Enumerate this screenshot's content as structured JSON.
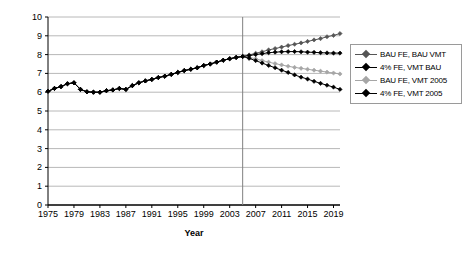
{
  "chart_data": {
    "type": "line",
    "title": "",
    "xlabel": "Year",
    "ylabel": "Million barrels gasoline/day",
    "xlim": [
      1975,
      2020
    ],
    "ylim": [
      0,
      10
    ],
    "yticks": [
      0,
      1,
      2,
      3,
      4,
      5,
      6,
      7,
      8,
      9,
      10
    ],
    "xticks": [
      1975,
      1979,
      1983,
      1987,
      1991,
      1995,
      1999,
      2003,
      2007,
      2011,
      2015,
      2019
    ],
    "grid": true,
    "legend_position": "right",
    "annotations": [
      {
        "type": "vline",
        "x": 2005,
        "label": ""
      }
    ],
    "x": [
      1975,
      1976,
      1977,
      1978,
      1979,
      1980,
      1981,
      1982,
      1983,
      1984,
      1985,
      1986,
      1987,
      1988,
      1989,
      1990,
      1991,
      1992,
      1993,
      1994,
      1995,
      1996,
      1997,
      1998,
      1999,
      2000,
      2001,
      2002,
      2003,
      2004,
      2005,
      2006,
      2007,
      2008,
      2009,
      2010,
      2011,
      2012,
      2013,
      2014,
      2015,
      2016,
      2017,
      2018,
      2019,
      2020
    ],
    "series": [
      {
        "name": "BAU FE, BAU VMT",
        "color": "#555555",
        "marker": "diamond",
        "values": [
          6.05,
          6.2,
          6.3,
          6.45,
          6.5,
          6.15,
          6.02,
          6.0,
          6.0,
          6.08,
          6.12,
          6.2,
          6.15,
          6.35,
          6.5,
          6.6,
          6.68,
          6.78,
          6.85,
          6.95,
          7.05,
          7.15,
          7.22,
          7.3,
          7.42,
          7.5,
          7.6,
          7.7,
          7.78,
          7.85,
          7.9,
          7.98,
          8.07,
          8.15,
          8.25,
          8.32,
          8.4,
          8.48,
          8.55,
          8.62,
          8.7,
          8.78,
          8.85,
          8.95,
          9.02,
          9.12
        ]
      },
      {
        "name": "4% FE, VMT BAU",
        "color": "#000000",
        "marker": "diamond",
        "values": [
          6.05,
          6.2,
          6.3,
          6.45,
          6.5,
          6.15,
          6.02,
          6.0,
          6.0,
          6.08,
          6.12,
          6.2,
          6.15,
          6.35,
          6.5,
          6.6,
          6.68,
          6.78,
          6.85,
          6.95,
          7.05,
          7.15,
          7.22,
          7.3,
          7.42,
          7.5,
          7.6,
          7.7,
          7.78,
          7.85,
          7.9,
          7.95,
          8.0,
          8.05,
          8.1,
          8.13,
          8.15,
          8.16,
          8.16,
          8.15,
          8.13,
          8.12,
          8.1,
          8.09,
          8.08,
          8.08
        ]
      },
      {
        "name": "BAU FE, VMT 2005",
        "color": "#a6a6a6",
        "marker": "diamond",
        "values": [
          6.05,
          6.2,
          6.3,
          6.45,
          6.5,
          6.15,
          6.02,
          6.0,
          6.0,
          6.08,
          6.12,
          6.2,
          6.15,
          6.35,
          6.5,
          6.6,
          6.68,
          6.78,
          6.85,
          6.95,
          7.05,
          7.15,
          7.22,
          7.3,
          7.42,
          7.5,
          7.6,
          7.7,
          7.78,
          7.85,
          7.9,
          7.85,
          7.78,
          7.68,
          7.6,
          7.52,
          7.45,
          7.38,
          7.32,
          7.27,
          7.22,
          7.17,
          7.12,
          7.07,
          7.02,
          6.97
        ]
      },
      {
        "name": "4% FE, VMT 2005",
        "color": "#000000",
        "marker": "diamond",
        "values": [
          6.05,
          6.2,
          6.3,
          6.45,
          6.5,
          6.15,
          6.02,
          6.0,
          6.0,
          6.08,
          6.12,
          6.2,
          6.15,
          6.35,
          6.5,
          6.6,
          6.68,
          6.78,
          6.85,
          6.95,
          7.05,
          7.15,
          7.22,
          7.3,
          7.42,
          7.5,
          7.6,
          7.7,
          7.78,
          7.85,
          7.9,
          7.8,
          7.68,
          7.55,
          7.42,
          7.3,
          7.17,
          7.05,
          6.92,
          6.8,
          6.7,
          6.58,
          6.47,
          6.37,
          6.27,
          6.15
        ]
      }
    ]
  },
  "legend": {
    "items": [
      {
        "label": "BAU FE, BAU VMT"
      },
      {
        "label": "4% FE, VMT BAU"
      },
      {
        "label": "BAU FE, VMT 2005"
      },
      {
        "label": "4% FE, VMT 2005"
      }
    ]
  },
  "axes": {
    "x_title": "Year",
    "y_title": "Million barrels gasoline/day"
  }
}
